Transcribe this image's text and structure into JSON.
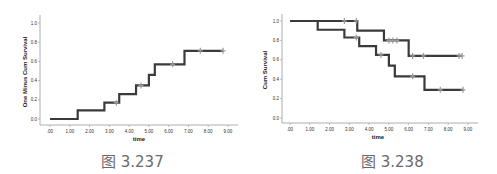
{
  "figures": [
    {
      "caption": "图 3.237",
      "xlabel": "time",
      "ylabel": "One Minus Cum Survival"
    },
    {
      "caption": "图 3.238",
      "xlabel": "time",
      "ylabel": "Cum Survival"
    }
  ],
  "colors": {
    "line": "#3a3a3a",
    "censor": "#9a9a9a",
    "axis": "#999999",
    "caption": "#6a6a6a"
  },
  "chart_data": [
    {
      "type": "line",
      "subtype": "step (Kaplan-Meier, one minus survival)",
      "title": "",
      "caption": "图 3.237",
      "xlabel": "time",
      "ylabel": "One Minus Cum Survival",
      "xticks": [
        ".00",
        "1.00",
        "2.00",
        "3.00",
        "4.00",
        "5.00",
        "6.00",
        "7.00",
        "8.00",
        "9.00"
      ],
      "yticks": [
        "0.0",
        "0.2",
        "0.4",
        "0.6",
        "0.8",
        "1.0"
      ],
      "xlim": [
        0,
        9
      ],
      "ylim": [
        0,
        1.0
      ],
      "grid": false,
      "legend": null,
      "series": [
        {
          "name": "cumulative failure",
          "steps": [
            {
              "x": 0.0,
              "y": 0.0
            },
            {
              "x": 1.4,
              "y": 0.09
            },
            {
              "x": 2.75,
              "y": 0.17
            },
            {
              "x": 3.5,
              "y": 0.26
            },
            {
              "x": 4.35,
              "y": 0.35
            },
            {
              "x": 5.0,
              "y": 0.46
            },
            {
              "x": 5.3,
              "y": 0.57
            },
            {
              "x": 6.8,
              "y": 0.71
            },
            {
              "x": 8.75,
              "y": 0.71
            }
          ],
          "censored": [
            {
              "x": 3.35,
              "y": 0.17
            },
            {
              "x": 4.6,
              "y": 0.35
            },
            {
              "x": 6.2,
              "y": 0.57
            },
            {
              "x": 7.6,
              "y": 0.71
            },
            {
              "x": 8.75,
              "y": 0.71
            }
          ]
        }
      ]
    },
    {
      "type": "line",
      "subtype": "step (Kaplan-Meier survival)",
      "title": "",
      "caption": "图 3.238",
      "xlabel": "time",
      "ylabel": "Cum Survival",
      "xticks": [
        ".00",
        "1.00",
        "2.00",
        "3.00",
        "4.00",
        "5.00",
        "6.00",
        "7.00",
        "8.00",
        "9.00"
      ],
      "yticks": [
        "0.0",
        "0.2",
        "0.4",
        "0.6",
        "0.8",
        "1.0"
      ],
      "xlim": [
        0,
        9
      ],
      "ylim": [
        0,
        1.0
      ],
      "grid": false,
      "legend": null,
      "series": [
        {
          "name": "group A (upper)",
          "steps": [
            {
              "x": 0.0,
              "y": 1.0
            },
            {
              "x": 3.4,
              "y": 0.9
            },
            {
              "x": 4.75,
              "y": 0.8
            },
            {
              "x": 6.0,
              "y": 0.64
            },
            {
              "x": 8.7,
              "y": 0.64
            }
          ],
          "censored": [
            {
              "x": 2.75,
              "y": 1.0
            },
            {
              "x": 3.35,
              "y": 1.0
            },
            {
              "x": 5.0,
              "y": 0.8
            },
            {
              "x": 5.2,
              "y": 0.8
            },
            {
              "x": 5.4,
              "y": 0.8
            },
            {
              "x": 6.2,
              "y": 0.64
            },
            {
              "x": 6.75,
              "y": 0.64
            },
            {
              "x": 8.55,
              "y": 0.64
            },
            {
              "x": 8.7,
              "y": 0.64
            }
          ]
        },
        {
          "name": "group B (lower)",
          "steps": [
            {
              "x": 0.0,
              "y": 1.0
            },
            {
              "x": 1.4,
              "y": 0.91
            },
            {
              "x": 2.75,
              "y": 0.83
            },
            {
              "x": 3.5,
              "y": 0.74
            },
            {
              "x": 4.35,
              "y": 0.65
            },
            {
              "x": 5.0,
              "y": 0.54
            },
            {
              "x": 5.3,
              "y": 0.43
            },
            {
              "x": 6.8,
              "y": 0.29
            },
            {
              "x": 8.75,
              "y": 0.29
            }
          ],
          "censored": [
            {
              "x": 3.35,
              "y": 0.83
            },
            {
              "x": 4.6,
              "y": 0.65
            },
            {
              "x": 6.2,
              "y": 0.43
            },
            {
              "x": 7.6,
              "y": 0.29
            },
            {
              "x": 8.75,
              "y": 0.29
            }
          ]
        }
      ]
    }
  ]
}
